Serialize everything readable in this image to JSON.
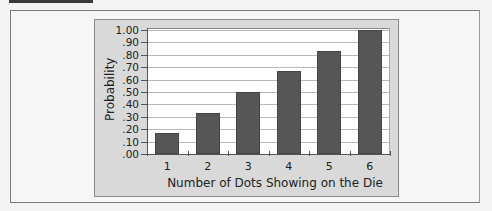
{
  "chart_data": {
    "type": "bar",
    "title": "",
    "xlabel": "Number of Dots Showing on the Die",
    "ylabel": "Probability",
    "categories": [
      "1",
      "2",
      "3",
      "4",
      "5",
      "6"
    ],
    "values": [
      0.167,
      0.333,
      0.5,
      0.667,
      0.833,
      1.0
    ],
    "ylim": [
      0,
      1.0
    ],
    "yticks": [
      ".00",
      ".10",
      ".20",
      ".30",
      ".40",
      ".50",
      ".60",
      ".70",
      ".80",
      ".90",
      "1.00"
    ],
    "grid": true,
    "legend": null,
    "colors": {
      "bar": "#565656",
      "panel": "#d9d9d9",
      "plot_bg": "#ffffff",
      "gridline": "#b9b9b9"
    }
  }
}
